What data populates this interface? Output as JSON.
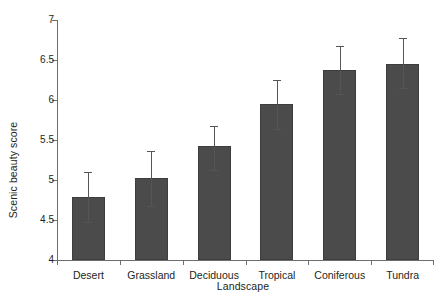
{
  "chart_data": {
    "type": "bar",
    "title": "",
    "xlabel": "Landscape",
    "ylabel": "Scenic beauty score",
    "categories": [
      "Desert",
      "Grassland",
      "Deciduous",
      "Tropical",
      "Coniferous",
      "Tundra"
    ],
    "values": [
      4.79,
      5.03,
      5.42,
      5.95,
      6.37,
      6.45
    ],
    "error_upper": [
      5.1,
      5.36,
      5.68,
      6.25,
      6.67,
      6.78
    ],
    "error_lower": [
      4.47,
      4.68,
      5.13,
      5.64,
      6.08,
      6.15
    ],
    "ylim": [
      4,
      7
    ],
    "yticks": [
      4,
      4.5,
      5,
      5.5,
      6,
      6.5,
      7
    ],
    "ytick_labels": [
      "4",
      "4.5",
      "5",
      "5.5",
      "6",
      "6.5",
      "7"
    ],
    "grid": false,
    "legend": null,
    "bar_color": "#4b4b4b",
    "error_color": "#555555",
    "axis_color": "#6e6e6e"
  }
}
